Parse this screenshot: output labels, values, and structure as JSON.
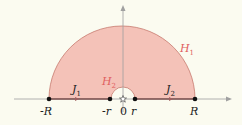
{
  "diagram": {
    "title": "",
    "type": "contour-diagram",
    "colors": {
      "background": "#fbfbf0",
      "region_fill": "#f4c2b8",
      "region_stroke": "#c77a6f",
      "axis": "#a0a0a0",
      "point": "#111111",
      "region_label": "#e06060"
    },
    "regions": [
      {
        "name": "H",
        "sub": "1",
        "description": "large upper half-disk of radius R"
      },
      {
        "name": "H",
        "sub": "2",
        "description": "small half-disk of radius r around origin"
      }
    ],
    "segments": [
      {
        "name": "J",
        "sub": "1",
        "from": "-R",
        "to": "-r"
      },
      {
        "name": "J",
        "sub": "2",
        "from": "r",
        "to": "R"
      }
    ],
    "points": [
      {
        "label": "-R"
      },
      {
        "label": "-r"
      },
      {
        "label": "0",
        "marker": "star"
      },
      {
        "label": "r"
      },
      {
        "label": "R"
      }
    ]
  }
}
